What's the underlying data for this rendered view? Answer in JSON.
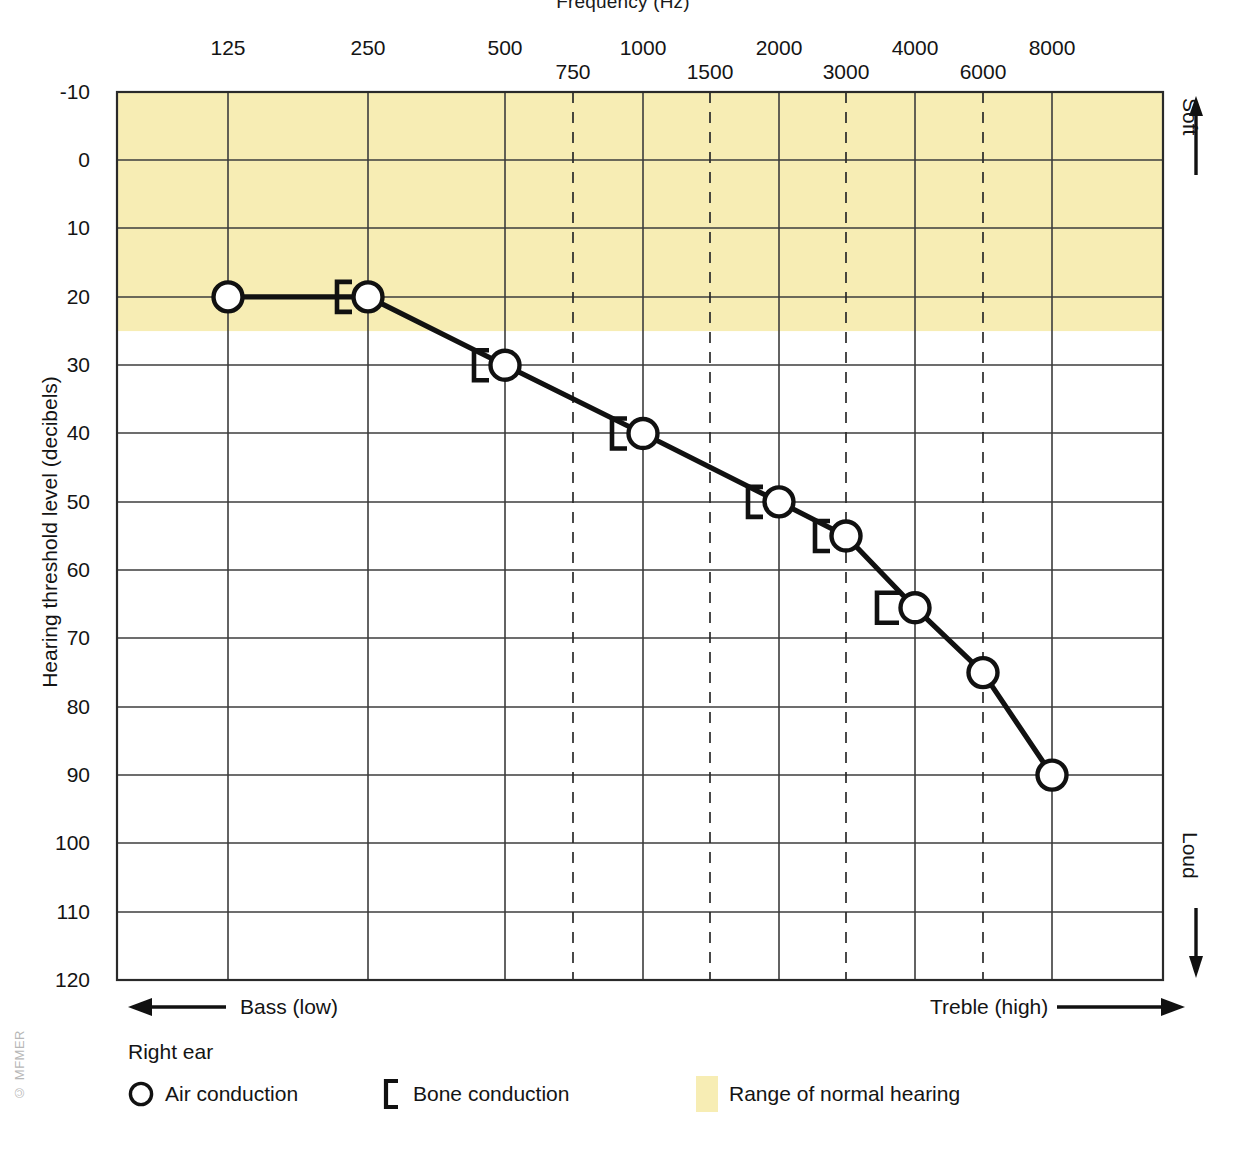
{
  "chart_data": {
    "type": "line",
    "title": "Frequency (Hz)",
    "xlabel": "Frequency (Hz)",
    "ylabel": "Hearing threshold level (decibels)",
    "ylim": [
      -10,
      120
    ],
    "y_ticks": [
      -10,
      0,
      10,
      20,
      30,
      40,
      50,
      60,
      70,
      80,
      90,
      100,
      110,
      120
    ],
    "x_ticks_octave": [
      125,
      250,
      500,
      1000,
      2000,
      4000,
      8000
    ],
    "x_ticks_interoctave": [
      750,
      1500,
      3000,
      6000
    ],
    "grid": true,
    "legend_position": "bottom",
    "normal_hearing_band": {
      "from_db": -10,
      "to_db": 25,
      "color": "#f7edb4",
      "label": "Range of normal hearing"
    },
    "series": [
      {
        "name": "Air conduction",
        "ear": "Right ear",
        "symbol": "circle",
        "x": [
          125,
          250,
          500,
          1000,
          2000,
          3000,
          4000,
          6000,
          8000
        ],
        "values": [
          20,
          20,
          30,
          40,
          50,
          55,
          65.5,
          75,
          90
        ]
      },
      {
        "name": "Bone conduction",
        "ear": "Right ear",
        "symbol": "bracket-left",
        "x": [
          250,
          500,
          1000,
          2000,
          3000,
          4000
        ],
        "values": [
          20,
          30,
          40,
          50,
          55,
          65.5
        ]
      }
    ],
    "annotations": [
      {
        "name": "soft",
        "text": "Soft",
        "arrow": "up",
        "position": "right-top"
      },
      {
        "name": "loud",
        "text": "Loud",
        "arrow": "down",
        "position": "right-bottom"
      },
      {
        "name": "bass",
        "text": "Bass (low)",
        "arrow": "left",
        "position": "bottom-left"
      },
      {
        "name": "treble",
        "text": "Treble (high)",
        "arrow": "right",
        "position": "bottom-right"
      }
    ]
  },
  "axes": {
    "x_title": "Frequency (Hz)",
    "y_title": "Hearing threshold level (decibels)",
    "y_labels": [
      "-10",
      "0",
      "10",
      "20",
      "30",
      "40",
      "50",
      "60",
      "70",
      "80",
      "90",
      "100",
      "110",
      "120"
    ],
    "x_labels_octave": [
      "125",
      "250",
      "500",
      "1000",
      "2000",
      "4000",
      "8000"
    ],
    "x_labels_interoctave": [
      "750",
      "1500",
      "3000",
      "6000"
    ]
  },
  "annotations": {
    "soft": "Soft",
    "loud": "Loud",
    "bass": "Bass (low)",
    "treble": "Treble (high)"
  },
  "legend": {
    "title": "Right ear",
    "items": [
      {
        "label": "Air conduction",
        "symbol": "circle-icon"
      },
      {
        "label": "Bone conduction",
        "symbol": "bracket-icon"
      },
      {
        "label": "Range of normal hearing",
        "symbol": "color-swatch"
      }
    ]
  },
  "copyright": "© MFMER",
  "colors": {
    "normal_band": "#f7edb4",
    "curve": "#111111",
    "grid": "#3c3c3c",
    "text": "#141414"
  }
}
